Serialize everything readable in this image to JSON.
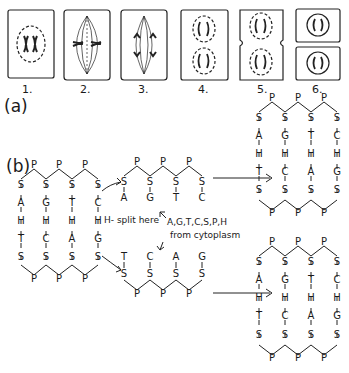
{
  "part_a": {
    "label": "(a)",
    "stages": [
      {
        "number": "1.",
        "name": "prophase"
      },
      {
        "number": "2.",
        "name": "metaphase"
      },
      {
        "number": "3.",
        "name": "anaphase"
      },
      {
        "number": "4.",
        "name": "telophase"
      },
      {
        "number": "5.",
        "name": "cleavage"
      },
      {
        "number": "6.",
        "name": "daughter-cells"
      }
    ]
  },
  "part_b": {
    "label": "(b)",
    "split_note": "H- split here",
    "cytoplasm_note_line1": "A,G,T,C,S,P,H",
    "cytoplasm_note_line2": "from cytoplasm",
    "original": {
      "top_p": [
        "P",
        "P",
        "P"
      ],
      "left_strand": [
        "S",
        "A",
        "H",
        "T",
        "S"
      ],
      "col2": [
        "S",
        "G",
        "H",
        "C",
        "S"
      ],
      "col3": [
        "S",
        "T",
        "H",
        "A",
        "S"
      ],
      "right_strand": [
        "S",
        "C",
        "H",
        "G",
        "S"
      ],
      "bottom_p": [
        "P",
        "P",
        "P"
      ]
    },
    "upper_half": {
      "top_p": [
        "P",
        "P",
        "P"
      ],
      "sugars": [
        "S",
        "S",
        "S",
        "S"
      ],
      "bases": [
        "A",
        "G",
        "T",
        "C"
      ]
    },
    "lower_half": {
      "bases": [
        "T",
        "C",
        "A",
        "G"
      ],
      "sugars": [
        "S",
        "S",
        "S",
        "S"
      ],
      "bottom_p": [
        "P",
        "P",
        "P"
      ]
    },
    "new_upper": {
      "top_p": [
        "P",
        "P",
        "P"
      ],
      "cols": [
        [
          "S",
          "A",
          "H",
          "T",
          "S"
        ],
        [
          "S",
          "G",
          "H",
          "C",
          "S"
        ],
        [
          "S",
          "T",
          "H",
          "A",
          "S"
        ],
        [
          "S",
          "C",
          "H",
          "G",
          "S"
        ]
      ],
      "bottom_p": [
        "P",
        "P",
        "P"
      ]
    },
    "new_lower": {
      "top_p": [
        "P",
        "P",
        "P"
      ],
      "cols": [
        [
          "S",
          "A",
          "H",
          "T",
          "S"
        ],
        [
          "S",
          "G",
          "H",
          "C",
          "S"
        ],
        [
          "S",
          "T",
          "H",
          "A",
          "S"
        ],
        [
          "S",
          "C",
          "H",
          "G",
          "S"
        ]
      ],
      "bottom_p": [
        "P",
        "P",
        "P"
      ]
    }
  }
}
